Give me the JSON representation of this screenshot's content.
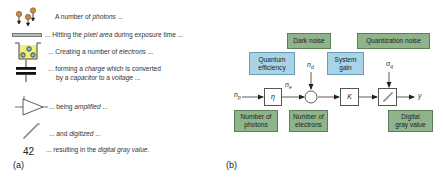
{
  "panel_a": {
    "label": "(a)",
    "steps": [
      {
        "icon": "photons-icon",
        "pre": "A number of ",
        "em": "photons",
        "post": " ..."
      },
      {
        "icon": "pixel-area-icon",
        "pre": "... Hitting the ",
        "em": "pixel area",
        "post": " during exposure time ..."
      },
      {
        "icon": "electron-well-icon",
        "pre": "... Creating a number of ",
        "em": "electrons",
        "post": " ..."
      },
      {
        "icon": "capacitor-icon",
        "pre": "... forming a ",
        "em": "charge",
        "post": " which is converted"
      },
      {
        "icon": "",
        "pre": "by a ",
        "em": "capacitor",
        "post": " to a ",
        "em2": "voltage",
        "post2": " ..."
      },
      {
        "icon": "amplifier-icon",
        "pre": "... being ",
        "em": "amplified",
        "post": " ..."
      },
      {
        "icon": "digitizer-icon",
        "pre": "... and ",
        "em": "digitized",
        "post": " ..."
      },
      {
        "icon": "gray-value-number",
        "pre": "... resulting in the ",
        "em": "digital gray value",
        "post": "."
      }
    ],
    "gray_value": "42"
  },
  "panel_b": {
    "label": "(b)",
    "noise_boxes": {
      "dark_noise": "Dark noise",
      "quantization_noise": "Quantization noise"
    },
    "param_boxes": {
      "quantum_efficiency_line1": "Quantum",
      "quantum_efficiency_line2": "efficiency",
      "system_gain_line1": "System",
      "system_gain_line2": "gain"
    },
    "quantity_boxes": {
      "photons_line1": "Number of",
      "photons_line2": "photons",
      "electrons_line1": "Number of",
      "electrons_line2": "electrons",
      "gray_line1": "Digital",
      "gray_line2": "gray value"
    },
    "symbols": {
      "n": "n",
      "p_sub": "p",
      "e_sub": "e",
      "d_sub": "d",
      "sigma": "σ",
      "q_sub": "q",
      "eta": "η",
      "K": "K",
      "y": "y"
    },
    "colors": {
      "green_box": "#8fb38a",
      "blue_box": "#a9d3e6"
    }
  }
}
